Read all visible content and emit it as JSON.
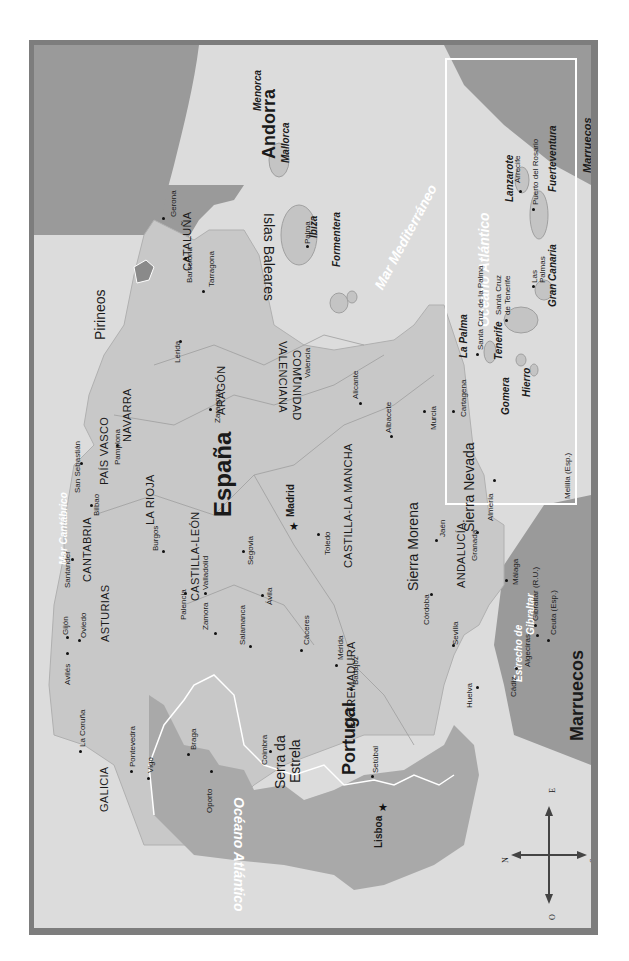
{
  "map": {
    "orientation": "rotated 90° clockwise (north points left)",
    "colors": {
      "frame": "#7d7d7d",
      "sea": "#dcdcdc",
      "spain_land": "#c8c8c8",
      "portugal_land": "#a9a9a9",
      "foreign_land": "#9a9a9a",
      "border": "#ffffff",
      "text": "#1a1a1a"
    },
    "countries": {
      "spain": "España",
      "portugal": "Portugal",
      "andorra": "Andorra",
      "morocco_main": "Marruecos",
      "morocco_inset": "Marruecos"
    },
    "seas": {
      "atlantic": "Océano Atlántico",
      "mediterranean": "Mar Mediterráneo",
      "cantabrico": "Mar Cantábrico",
      "strait_1": "Estrecho de",
      "strait_2": "Gibraltar",
      "inset_atlantic": "Océano Atlántico"
    },
    "regions": {
      "galicia": "GALICIA",
      "asturias": "ASTURIAS",
      "cantabria": "CANTABRIA",
      "pais_vasco": "PAÍS VASCO",
      "navarra": "NAVARRA",
      "la_rioja": "LA RIOJA",
      "aragon": "ARAGÓN",
      "cataluna": "CATALUÑA",
      "castilla_leon": "CASTILLA-LEÓN",
      "castilla_la_mancha": "CASTILLA-LA MANCHA",
      "extremadura": "EXTREMADURA",
      "andalucia": "ANDALUCÍA",
      "comunidad_valenciana_1": "COMUNIDAD",
      "comunidad_valenciana_2": "VALENCIANA"
    },
    "mountains": {
      "pirineos": "Pirineos",
      "sierra_morena": "Sierra Morena",
      "sierra_nevada": "Sierra Nevada",
      "serra_estrela_1": "Serra da",
      "serra_estrela_2": "Estrela"
    },
    "islands": {
      "islas_baleares": "Islas Baleares",
      "menorca": "Menorca",
      "mallorca": "Mallorca",
      "ibiza": "Ibiza",
      "formentera": "Formentera",
      "la_palma": "La Palma",
      "tenerife": "Tenerife",
      "gomera": "Gomera",
      "hierro": "Hierro",
      "gran_canaria": "Gran Canaria",
      "lanzarote": "Lanzarote",
      "fuerteventura": "Fuerteventura"
    },
    "capitals": {
      "madrid": "Madrid",
      "lisboa": "Lisboa"
    },
    "cities": {
      "gerona": "Gerona",
      "barcelona": "Barcelona",
      "tarragona": "Tarragona",
      "lerida": "Lérida",
      "zaragoza": "Zaragoza",
      "valencia": "Valencia",
      "alicante": "Alicante",
      "albacete": "Albacete",
      "murcia": "Murcia",
      "cartagena": "Cartagena",
      "almeria": "Almería",
      "granada": "Granada",
      "jaen": "Jaén",
      "malaga": "Málaga",
      "cordoba": "Córdoba",
      "sevilla": "Sevilla",
      "cadiz": "Cádiz",
      "huelva": "Huelva",
      "algeciras": "Algeciras",
      "gibraltar": "Gibraltar (R.U.)",
      "ceuta": "Ceuta (Esp.)",
      "melilla": "Melilla (Esp.)",
      "toledo": "Toledo",
      "segovia": "Segovia",
      "avila": "Ávila",
      "salamanca": "Salamanca",
      "zamora": "Zamora",
      "valladolid": "Valladolid",
      "palencia": "Palencia",
      "burgos": "Burgos",
      "pamplona": "Pamplona",
      "bilbao": "Bilbao",
      "san_sebastian": "San Sebastián",
      "santander": "Santander",
      "oviedo": "Oviedo",
      "gijon": "Gijón",
      "aviles": "Avilés",
      "la_coruna": "La Coruña",
      "pontevedra": "Pontevedra",
      "vigo": "Vigo",
      "caceres": "Cáceres",
      "merida": "Mérida",
      "badajoz": "Badajoz",
      "braga": "Braga",
      "oporto": "Oporto",
      "coimbra": "Coimbra",
      "setubal": "Setúbal",
      "palma": "Palma",
      "santa_cruz_palma": "Santa Cruz de la Palma",
      "santa_cruz_tenerife_1": "Santa Cruz",
      "santa_cruz_tenerife_2": "de Tenerife",
      "las_palmas_1": "Las",
      "las_palmas_2": "Palmas",
      "arrecife": "Arrecife",
      "puerto_rosario": "Puerto del Rosario"
    },
    "compass": {
      "n": "N",
      "s": "S",
      "e": "E",
      "o": "O"
    }
  }
}
